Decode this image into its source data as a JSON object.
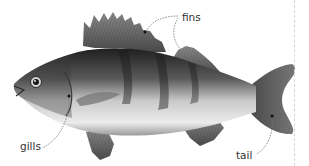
{
  "diagram": {
    "labels": [
      {
        "id": "fins",
        "text": "fins",
        "x": 182,
        "y": 12
      },
      {
        "id": "gills",
        "text": "gills",
        "x": 20,
        "y": 141
      },
      {
        "id": "tail",
        "text": "tail",
        "x": 236,
        "y": 150
      }
    ]
  },
  "colors": {
    "fish_dark": "#2a2a2a",
    "fish_mid": "#6e6e6e",
    "fish_light": "#e2e2e2",
    "leader_line": "#777777",
    "divider": "#d4d4d4",
    "label_text": "#333333"
  }
}
